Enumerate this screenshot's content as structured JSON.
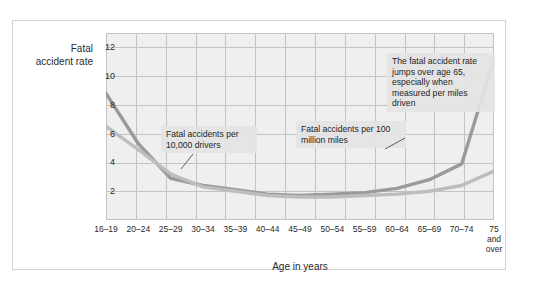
{
  "chart_data": {
    "type": "line",
    "title": "",
    "xlabel": "Age in years",
    "ylabel": "Fatal accident rate",
    "ylim": [
      0,
      13
    ],
    "yticks": [
      2,
      4,
      6,
      8,
      10,
      12
    ],
    "grid": true,
    "legend_position": "inline-annotations",
    "categories": [
      "16–19",
      "20–24",
      "25–29",
      "30–34",
      "35–39",
      "40–44",
      "45–49",
      "50–54",
      "55–59",
      "60–64",
      "65–69",
      "70–74",
      "75\nand\nover"
    ],
    "series": [
      {
        "name": "Fatal accidents per 100 million miles",
        "color": "#9a9a9a",
        "values": [
          8.8,
          5.3,
          2.9,
          2.4,
          2.1,
          1.8,
          1.7,
          1.8,
          1.9,
          2.2,
          2.8,
          3.9,
          11.2
        ]
      },
      {
        "name": "Fatal accidents per 10,000 drivers",
        "color": "#bdbdbd",
        "values": [
          6.5,
          4.9,
          3.2,
          2.3,
          2.0,
          1.7,
          1.6,
          1.6,
          1.7,
          1.8,
          2.0,
          2.4,
          3.4
        ]
      }
    ],
    "annotations": [
      {
        "id": "drivers",
        "text": "Fatal accidents per 10,000 drivers"
      },
      {
        "id": "miles",
        "text": "Fatal accidents per 100 million miles"
      },
      {
        "id": "jump",
        "text": "The fatal accident rate jumps over age 65, especially when measured per miles driven"
      }
    ]
  },
  "axis": {
    "y_title": "Fatal accident rate",
    "x_title": "Age in years",
    "y_tick_labels": [
      "12",
      "10",
      "8",
      "6",
      "4",
      "2"
    ],
    "x_tick_labels": [
      "16–19",
      "20–24",
      "25–29",
      "30–34",
      "35–39",
      "40–44",
      "45–49",
      "50–54",
      "55–59",
      "60–64",
      "65–69",
      "70–74",
      "75\nand\nover"
    ]
  },
  "callouts": {
    "drivers": "Fatal accidents per 10,000 drivers",
    "miles": "Fatal accidents per 100 million miles",
    "jump": "The fatal accident rate jumps over age 65, especially when measured per miles driven"
  },
  "colors": {
    "series_dark": "#9a9a9a",
    "series_light": "#bdbdbd",
    "plot_background": "#efefef",
    "grid": "#c3c3c3",
    "frame_border": "#d2d2d2"
  }
}
